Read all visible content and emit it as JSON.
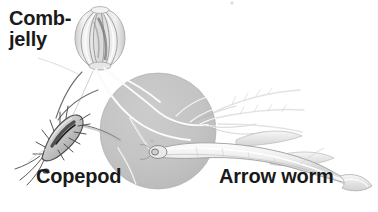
{
  "figure": {
    "background_color": "#ffffff",
    "width": 378,
    "height": 212
  },
  "scale_circle": {
    "name": "gray-scale-circle",
    "center_x": 158,
    "center_y": 131,
    "radius": 58,
    "fill_color": "#c3c3c3",
    "edge_color": "#b5b5b5"
  },
  "labels": {
    "comb_jelly_line1": "Comb-",
    "comb_jelly_line2": "jelly",
    "copepod": "Copepod",
    "arrow_worm": "Arrow worm",
    "text_color": "#1a1a1a"
  },
  "organisms": [
    {
      "name": "comb-jelly",
      "label": "Comb-jelly",
      "description": "Oval gelatinous body with eight vertical comb rows and two long trailing tentacles",
      "body_center_x": 100,
      "body_center_y": 38,
      "body_width": 50,
      "body_height": 60,
      "body_color": "#e8e8e8",
      "rib_color": "#9a9a9a"
    },
    {
      "name": "copepod",
      "label": "Copepod",
      "description": "Small elongated crustacean with spiny setae and long antennae, oriented diagonally",
      "body_center_x": 62,
      "body_center_y": 131,
      "body_length": 46,
      "body_color": "#d6d6d6",
      "outline_color": "#5a5a5a"
    },
    {
      "name": "arrow-worm",
      "label": "Arrow worm",
      "description": "Long transparent chaetognath with blunt head, lateral fins and forked tail fin",
      "head_x": 156,
      "head_y": 153,
      "tail_x": 352,
      "tail_y": 178,
      "body_color": "#e3e3e3",
      "outline_color": "#a0a0a0"
    }
  ],
  "tentacles": {
    "name": "comb-jelly-tentacles",
    "color": "#ffffff",
    "shadow_color": "#a9a9a9",
    "count": 2,
    "description": "Two fine branching tentacles sweeping from the comb jelly across the gray circle"
  },
  "annotation_marks": {
    "leader_lines": [
      {
        "name": "comb-jelly-leader",
        "from_x": 38,
        "from_y": 56,
        "to_x": 88,
        "to_y": 72
      },
      {
        "name": "copepod-leader",
        "from_x": 46,
        "from_y": 165,
        "to_x": 30,
        "to_y": 150
      },
      {
        "name": "arrow-worm-leader",
        "from_x": 300,
        "from_y": 164,
        "to_x": 315,
        "to_y": 150
      }
    ]
  }
}
